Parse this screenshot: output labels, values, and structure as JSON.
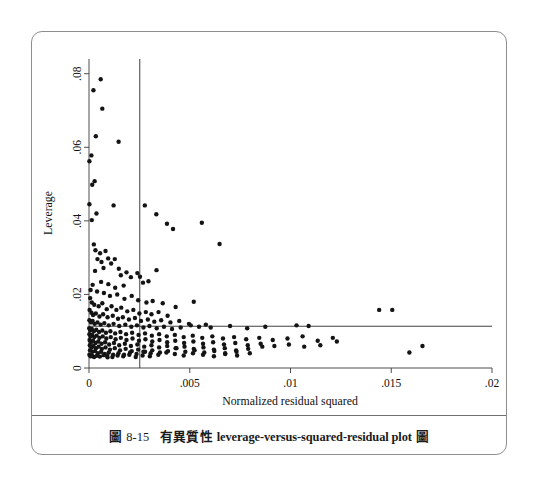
{
  "figure": {
    "caption_number_prefix": "圖",
    "caption_number": "8-15",
    "caption_cjk_lead": "有異質性",
    "caption_english": "leverage-versus-squared-residual plot",
    "caption_cjk_trail": "圖",
    "caption_full": "圖 8-15  有異質性 leverage-versus-squared-residual plot 圖",
    "border_color": "#8e8e90"
  },
  "chart_data": {
    "type": "scatter",
    "title": "",
    "xlabel": "Normalized residual squared",
    "ylabel": "Leverage",
    "xlim": [
      0,
      0.02
    ],
    "ylim": [
      0,
      0.084
    ],
    "grid": false,
    "legend": false,
    "marker_color": "#141414",
    "marker_size_px": 4.4,
    "xticks": [
      0,
      0.005,
      0.01,
      0.015,
      0.02
    ],
    "xtick_labels": [
      "0",
      ".005",
      ".01",
      ".015",
      ".02"
    ],
    "yticks": [
      0,
      0.02,
      0.04,
      0.06,
      0.08
    ],
    "ytick_labels": [
      "0",
      ".02",
      ".04",
      ".06",
      ".08"
    ],
    "reference_lines": [
      {
        "orientation": "vertical",
        "name": "mean-normalized-residual-squared",
        "value": 0.00252
      },
      {
        "orientation": "horizontal",
        "name": "mean-leverage",
        "value": 0.01135
      }
    ],
    "points": [
      [
        0.00058,
        0.0785
      ],
      [
        0.00022,
        0.0755
      ],
      [
        0.00066,
        0.0705
      ],
      [
        0.00147,
        0.0615
      ],
      [
        0.00034,
        0.063
      ],
      [
        0.00012,
        0.0578
      ],
      [
        2e-05,
        0.0562
      ],
      [
        0.00028,
        0.0508
      ],
      [
        0.00016,
        0.0498
      ],
      [
        2e-05,
        0.0445
      ],
      [
        0.00037,
        0.042
      ],
      [
        0.00014,
        0.0402
      ],
      [
        0.00122,
        0.0442
      ],
      [
        0.00277,
        0.0442
      ],
      [
        0.00334,
        0.0418
      ],
      [
        0.00387,
        0.0392
      ],
      [
        0.00417,
        0.0378
      ],
      [
        0.0056,
        0.0395
      ],
      [
        0.00648,
        0.0337
      ],
      [
        0.00024,
        0.0336
      ],
      [
        0.00032,
        0.032
      ],
      [
        0.00055,
        0.0312
      ],
      [
        0.00082,
        0.0318
      ],
      [
        0.00095,
        0.0298
      ],
      [
        0.00042,
        0.0296
      ],
      [
        0.00062,
        0.0288
      ],
      [
        0.0011,
        0.0284
      ],
      [
        0.00128,
        0.0296
      ],
      [
        0.00148,
        0.027
      ],
      [
        0.00072,
        0.0272
      ],
      [
        0.0003,
        0.0264
      ],
      [
        0.00158,
        0.0252
      ],
      [
        0.00186,
        0.026
      ],
      [
        0.00208,
        0.0247
      ],
      [
        0.0024,
        0.0258
      ],
      [
        0.00253,
        0.0248
      ],
      [
        0.00268,
        0.0232
      ],
      [
        0.00295,
        0.0236
      ],
      [
        0.00335,
        0.0266
      ],
      [
        0.0006,
        0.0234
      ],
      [
        0.00096,
        0.0228
      ],
      [
        0.0013,
        0.0218
      ],
      [
        0.00172,
        0.0224
      ],
      [
        0.00018,
        0.0226
      ],
      [
        8e-05,
        0.0212
      ],
      [
        0.0004,
        0.0208
      ],
      [
        0.00074,
        0.0204
      ],
      [
        0.00104,
        0.0196
      ],
      [
        0.0014,
        0.02
      ],
      [
        0.00176,
        0.0188
      ],
      [
        0.00212,
        0.0196
      ],
      [
        0.00244,
        0.0184
      ],
      [
        0.00285,
        0.0178
      ],
      [
        0.00316,
        0.0182
      ],
      [
        0.00366,
        0.0176
      ],
      [
        0.0043,
        0.0166
      ],
      [
        0.0052,
        0.018
      ],
      [
        6e-05,
        0.019
      ],
      [
        0.00014,
        0.0178
      ],
      [
        0.00026,
        0.0172
      ],
      [
        0.00048,
        0.0168
      ],
      [
        0.00066,
        0.0176
      ],
      [
        0.00088,
        0.016
      ],
      [
        0.00112,
        0.0168
      ],
      [
        0.00136,
        0.0158
      ],
      [
        0.0016,
        0.0164
      ],
      [
        0.0019,
        0.0154
      ],
      [
        0.0022,
        0.0158
      ],
      [
        0.0025,
        0.0148
      ],
      [
        0.00282,
        0.0152
      ],
      [
        0.0031,
        0.0146
      ],
      [
        0.00345,
        0.0152
      ],
      [
        0.0039,
        0.0142
      ],
      [
        3e-05,
        0.0158
      ],
      [
        0.00012,
        0.015
      ],
      [
        0.0002,
        0.0144
      ],
      [
        0.00034,
        0.0148
      ],
      [
        0.00052,
        0.014
      ],
      [
        0.0007,
        0.0146
      ],
      [
        0.00092,
        0.0138
      ],
      [
        0.00118,
        0.0142
      ],
      [
        0.00144,
        0.0134
      ],
      [
        0.00168,
        0.0138
      ],
      [
        0.00198,
        0.0132
      ],
      [
        0.00228,
        0.0136
      ],
      [
        0.00258,
        0.0128
      ],
      [
        0.00292,
        0.0132
      ],
      [
        0.00324,
        0.0126
      ],
      [
        0.00358,
        0.013
      ],
      [
        0.00404,
        0.0124
      ],
      [
        0.00448,
        0.0128
      ],
      [
        0.00496,
        0.012
      ],
      [
        2e-05,
        0.013
      ],
      [
        0.0001,
        0.0124
      ],
      [
        0.00018,
        0.0128
      ],
      [
        0.00028,
        0.012
      ],
      [
        0.00042,
        0.0124
      ],
      [
        0.00058,
        0.0118
      ],
      [
        0.00076,
        0.0122
      ],
      [
        0.00098,
        0.0116
      ],
      [
        0.00122,
        0.012
      ],
      [
        0.0015,
        0.0114
      ],
      [
        0.0018,
        0.0118
      ],
      [
        0.0021,
        0.0112
      ],
      [
        0.00238,
        0.0116
      ],
      [
        0.0027,
        0.011
      ],
      [
        0.003,
        0.0114
      ],
      [
        0.00336,
        0.0108
      ],
      [
        0.00372,
        0.0112
      ],
      [
        0.00412,
        0.0106
      ],
      [
        0.00455,
        0.011
      ],
      [
        0.00505,
        0.0116
      ],
      [
        0.00546,
        0.0112
      ],
      [
        0.0058,
        0.0118
      ],
      [
        0.00604,
        0.011
      ],
      [
        0.007,
        0.0114
      ],
      [
        0.00785,
        0.0108
      ],
      [
        0.00875,
        0.0112
      ],
      [
        0.0103,
        0.0116
      ],
      [
        0.0109,
        0.0114
      ],
      [
        0.0144,
        0.0158
      ],
      [
        0.01505,
        0.0158
      ],
      [
        1e-05,
        0.0108
      ],
      [
        6e-05,
        0.0102
      ],
      [
        0.00014,
        0.0106
      ],
      [
        0.00024,
        0.01
      ],
      [
        0.00036,
        0.0104
      ],
      [
        0.0005,
        0.0098
      ],
      [
        0.00066,
        0.0102
      ],
      [
        0.00084,
        0.0096
      ],
      [
        0.00106,
        0.01
      ],
      [
        0.0013,
        0.0094
      ],
      [
        0.00156,
        0.0098
      ],
      [
        0.00184,
        0.0092
      ],
      [
        0.00214,
        0.0096
      ],
      [
        0.00246,
        0.009
      ],
      [
        0.00278,
        0.0094
      ],
      [
        0.00312,
        0.0088
      ],
      [
        0.00348,
        0.0092
      ],
      [
        0.00386,
        0.0086
      ],
      [
        0.00426,
        0.009
      ],
      [
        0.0047,
        0.0084
      ],
      [
        0.00515,
        0.0088
      ],
      [
        0.00562,
        0.0082
      ],
      [
        0.00612,
        0.0086
      ],
      [
        0.00665,
        0.008
      ],
      [
        0.0072,
        0.0084
      ],
      [
        0.0078,
        0.0078
      ],
      [
        0.00845,
        0.0082
      ],
      [
        0.00912,
        0.0076
      ],
      [
        0.00985,
        0.008
      ],
      [
        0.0106,
        0.0086
      ],
      [
        0.01135,
        0.0074
      ],
      [
        0.0121,
        0.0082
      ],
      [
        2e-05,
        0.0092
      ],
      [
        8e-05,
        0.0086
      ],
      [
        0.00016,
        0.009
      ],
      [
        0.00026,
        0.0084
      ],
      [
        0.00038,
        0.0088
      ],
      [
        0.00052,
        0.0082
      ],
      [
        0.00068,
        0.0086
      ],
      [
        0.00086,
        0.008
      ],
      [
        0.00108,
        0.0084
      ],
      [
        0.00132,
        0.0078
      ],
      [
        0.00158,
        0.0082
      ],
      [
        0.00186,
        0.0076
      ],
      [
        0.00216,
        0.008
      ],
      [
        0.00248,
        0.0074
      ],
      [
        0.0028,
        0.0078
      ],
      [
        0.00314,
        0.0072
      ],
      [
        0.0035,
        0.0076
      ],
      [
        0.00388,
        0.007
      ],
      [
        0.00428,
        0.0074
      ],
      [
        0.00472,
        0.0068
      ],
      [
        0.00518,
        0.0072
      ],
      [
        0.00566,
        0.0066
      ],
      [
        0.00616,
        0.007
      ],
      [
        0.0067,
        0.0064
      ],
      [
        0.00726,
        0.0068
      ],
      [
        0.00788,
        0.0062
      ],
      [
        0.00852,
        0.0066
      ],
      [
        0.0092,
        0.006
      ],
      [
        0.00992,
        0.0064
      ],
      [
        0.01068,
        0.0058
      ],
      [
        0.01148,
        0.0062
      ],
      [
        0.0123,
        0.0072
      ],
      [
        3e-05,
        0.0076
      ],
      [
        0.0001,
        0.007
      ],
      [
        0.0002,
        0.0074
      ],
      [
        0.00032,
        0.0068
      ],
      [
        0.00046,
        0.0072
      ],
      [
        0.00062,
        0.0066
      ],
      [
        0.0008,
        0.007
      ],
      [
        0.001,
        0.0064
      ],
      [
        0.00124,
        0.0068
      ],
      [
        0.0015,
        0.0062
      ],
      [
        0.00178,
        0.0066
      ],
      [
        0.00208,
        0.006
      ],
      [
        0.0024,
        0.0064
      ],
      [
        0.00274,
        0.0058
      ],
      [
        0.0031,
        0.0062
      ],
      [
        0.00348,
        0.0056
      ],
      [
        0.00388,
        0.006
      ],
      [
        0.0043,
        0.0054
      ],
      [
        0.00474,
        0.0058
      ],
      [
        0.0052,
        0.0052
      ],
      [
        0.00568,
        0.0056
      ],
      [
        0.0062,
        0.005
      ],
      [
        0.00674,
        0.0054
      ],
      [
        0.0073,
        0.0048
      ],
      [
        0.0079,
        0.0052
      ],
      [
        0.0086,
        0.0058
      ],
      [
        4e-05,
        0.0062
      ],
      [
        0.00012,
        0.0056
      ],
      [
        0.00022,
        0.006
      ],
      [
        0.00034,
        0.0054
      ],
      [
        0.00048,
        0.0058
      ],
      [
        0.00064,
        0.0052
      ],
      [
        0.00082,
        0.0056
      ],
      [
        0.00104,
        0.005
      ],
      [
        0.00128,
        0.0054
      ],
      [
        0.00154,
        0.0048
      ],
      [
        0.00182,
        0.0052
      ],
      [
        0.00212,
        0.0046
      ],
      [
        0.00244,
        0.005
      ],
      [
        0.00278,
        0.0044
      ],
      [
        0.00314,
        0.0048
      ],
      [
        0.00352,
        0.0042
      ],
      [
        0.00392,
        0.0046
      ],
      [
        0.00434,
        0.0054
      ],
      [
        0.00478,
        0.0044
      ],
      [
        0.00524,
        0.0048
      ],
      [
        0.00572,
        0.0042
      ],
      [
        0.00622,
        0.0046
      ],
      [
        0.00676,
        0.004
      ],
      [
        0.00732,
        0.0044
      ],
      [
        0.0159,
        0.0042
      ],
      [
        0.01655,
        0.006
      ],
      [
        5e-05,
        0.0048
      ],
      [
        0.00016,
        0.0044
      ],
      [
        0.0003,
        0.0046
      ],
      [
        0.00044,
        0.004
      ],
      [
        0.0006,
        0.0044
      ],
      [
        0.00078,
        0.0038
      ],
      [
        0.00098,
        0.0042
      ],
      [
        0.0012,
        0.0036
      ],
      [
        0.00146,
        0.004
      ],
      [
        0.00174,
        0.0036
      ],
      [
        0.00204,
        0.0042
      ],
      [
        0.00236,
        0.0038
      ],
      [
        0.0027,
        0.0044
      ],
      [
        0.00306,
        0.004
      ],
      [
        0.00344,
        0.0036
      ],
      [
        0.00384,
        0.0042
      ],
      [
        0.00426,
        0.0038
      ],
      [
        0.0047,
        0.0034
      ],
      [
        0.00516,
        0.004
      ],
      [
        0.00566,
        0.0036
      ],
      [
        0.0062,
        0.0032
      ],
      [
        0.00676,
        0.0038
      ],
      [
        0.00735,
        0.0034
      ],
      [
        0.00798,
        0.004
      ],
      [
        0.0009,
        0.0034
      ],
      [
        0.00116,
        0.003
      ],
      [
        0.00142,
        0.0034
      ],
      [
        0.0017,
        0.0032
      ],
      [
        0.002,
        0.0036
      ],
      [
        0.00232,
        0.003
      ],
      [
        0.00266,
        0.0034
      ],
      [
        0.00302,
        0.0032
      ],
      [
        2e-05,
        0.0036
      ],
      [
        8e-05,
        0.0032
      ],
      [
        0.00015,
        0.0034
      ],
      [
        0.00025,
        0.003
      ],
      [
        0.00038,
        0.0033
      ],
      [
        0.00054,
        0.0031
      ],
      [
        0.00072,
        0.0035
      ],
      [
        0.00092,
        0.0029
      ]
    ]
  }
}
